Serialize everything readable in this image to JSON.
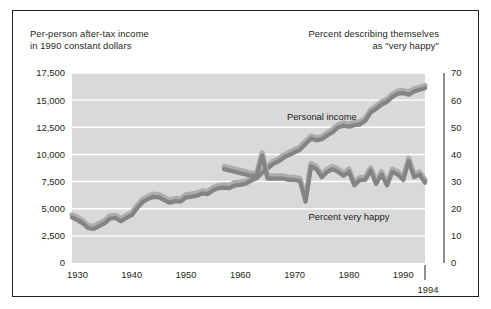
{
  "figure": {
    "caption_left": "Per-person after-tax income\nin 1990 constant dollars",
    "caption_right": "Percent describing themselves\nas \"very happy\"",
    "end_year_label": "1994"
  },
  "colors": {
    "plot_background": "#d9d9d9",
    "gridline": "#ffffff",
    "ribbon_dark": "#848484",
    "ribbon_light": "#adadad",
    "axis_text": "#231f20",
    "frame": "#231f20",
    "page_background": "#ffffff"
  },
  "chart_data": {
    "type": "line",
    "title": "",
    "subtitle": "",
    "xlabel": "",
    "ylabel": "Per-person after-tax income in 1990 constant dollars",
    "y2label": "Percent describing themselves as \"very happy\"",
    "grid": true,
    "legend_position": "inline-annotations",
    "xlim": [
      1929,
      1994
    ],
    "xticks": [
      1930,
      1940,
      1950,
      1960,
      1970,
      1980,
      1990
    ],
    "xticklabels": [
      "1930",
      "1940",
      "1950",
      "1960",
      "1970",
      "1980",
      "1990"
    ],
    "x_end_marker": 1994,
    "ylim": [
      0,
      17500
    ],
    "yticks": [
      0,
      2500,
      5000,
      7500,
      10000,
      12500,
      15000,
      17500
    ],
    "yticklabels": [
      "0",
      "2,500",
      "5,000",
      "7,500",
      "10,000",
      "12,500",
      "15,000",
      "17,500"
    ],
    "y2lim": [
      0,
      70
    ],
    "y2ticks": [
      0,
      10,
      20,
      30,
      40,
      50,
      60,
      70
    ],
    "y2ticklabels": [
      "0",
      "10",
      "20",
      "30",
      "40",
      "50",
      "60",
      "70"
    ],
    "series": [
      {
        "name": "Personal income",
        "label": "Personal income",
        "axis": "left",
        "units": "1990 constant dollars per person",
        "x": [
          1929,
          1930,
          1931,
          1932,
          1933,
          1934,
          1935,
          1936,
          1937,
          1938,
          1939,
          1940,
          1941,
          1942,
          1943,
          1944,
          1945,
          1946,
          1947,
          1948,
          1949,
          1950,
          1951,
          1952,
          1953,
          1954,
          1955,
          1956,
          1957,
          1958,
          1959,
          1960,
          1961,
          1962,
          1963,
          1964,
          1965,
          1966,
          1967,
          1968,
          1969,
          1970,
          1971,
          1972,
          1973,
          1974,
          1975,
          1976,
          1977,
          1978,
          1979,
          1980,
          1981,
          1982,
          1983,
          1984,
          1985,
          1986,
          1987,
          1988,
          1989,
          1990,
          1991,
          1992,
          1993,
          1994
        ],
        "values": [
          4300,
          4050,
          3750,
          3300,
          3250,
          3500,
          3750,
          4200,
          4250,
          3950,
          4250,
          4500,
          5150,
          5700,
          6000,
          6200,
          6150,
          5900,
          5650,
          5800,
          5750,
          6150,
          6200,
          6300,
          6500,
          6450,
          6800,
          7000,
          7050,
          7000,
          7250,
          7300,
          7400,
          7700,
          7900,
          8400,
          8800,
          9200,
          9450,
          9800,
          10050,
          10300,
          10550,
          11050,
          11550,
          11400,
          11500,
          11850,
          12150,
          12600,
          12750,
          12650,
          12800,
          12850,
          13200,
          13950,
          14300,
          14700,
          14950,
          15400,
          15700,
          15750,
          15600,
          15900,
          16050,
          16200
        ]
      },
      {
        "name": "Percent very happy",
        "label": "Percent very happy",
        "axis": "right",
        "units": "percent",
        "x": [
          1957,
          1958,
          1959,
          1960,
          1961,
          1962,
          1963,
          1964,
          1965,
          1966,
          1967,
          1968,
          1969,
          1970,
          1971,
          1972,
          1973,
          1974,
          1975,
          1976,
          1977,
          1978,
          1979,
          1980,
          1981,
          1982,
          1983,
          1984,
          1985,
          1986,
          1987,
          1988,
          1989,
          1990,
          1991,
          1992,
          1993,
          1994
        ],
        "values": [
          35,
          34.5,
          34,
          33.5,
          33,
          32.5,
          32.5,
          40,
          31.5,
          31.5,
          31.5,
          31.5,
          31,
          31,
          30.5,
          23,
          36,
          35,
          32,
          34,
          35,
          34,
          32.5,
          34,
          29,
          31,
          31,
          34.5,
          29.5,
          33,
          29,
          34,
          33,
          31,
          38,
          32,
          33,
          30
        ]
      }
    ],
    "annotations": [
      {
        "text": "Personal income",
        "x": 1975,
        "y_axis": "left",
        "y": 13200
      },
      {
        "text": "Percent very happy",
        "x": 1980,
        "y_axis": "right",
        "y": 16
      }
    ]
  }
}
